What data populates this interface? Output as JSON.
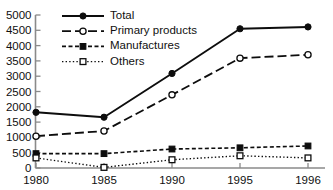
{
  "chart_data": {
    "type": "line",
    "title": "",
    "subtitle": "",
    "xlabel": "",
    "ylabel": "",
    "categories": [
      "1980",
      "1985",
      "1990",
      "1995",
      "1996"
    ],
    "x": [
      1980,
      1985,
      1990,
      1995,
      1996
    ],
    "ylim": [
      0,
      5000
    ],
    "yticks": [
      0,
      500,
      1000,
      1500,
      2000,
      2500,
      3000,
      3500,
      4000,
      4500,
      5000
    ],
    "ytick_labels": [
      "0",
      "500",
      "1000",
      "1500",
      "2000",
      "2500",
      "3000",
      "3500",
      "4000",
      "4500",
      "5000"
    ],
    "xtick_labels": [
      "1980",
      "1985",
      "1990",
      "1995",
      "1996"
    ],
    "grid": false,
    "legend_position": "top-center-inside",
    "series": [
      {
        "name": "Total",
        "values": [
          1820,
          1660,
          3090,
          4550,
          4610
        ],
        "line_style": "solid",
        "marker": "filled-circle",
        "color": "#0d0d0d"
      },
      {
        "name": "Primary products",
        "values": [
          1040,
          1210,
          2390,
          3590,
          3700
        ],
        "line_style": "long-dash",
        "marker": "open-circle",
        "color": "#0d0d0d"
      },
      {
        "name": "Manufactures",
        "values": [
          470,
          470,
          620,
          660,
          720
        ],
        "line_style": "short-dash",
        "marker": "filled-square",
        "color": "#0d0d0d"
      },
      {
        "name": "Others",
        "values": [
          330,
          20,
          270,
          400,
          330
        ],
        "line_style": "dotted",
        "marker": "open-square",
        "color": "#0d0d0d"
      }
    ]
  },
  "axes": {
    "axis_color": "#8a8a8a",
    "background": "#ffffff"
  }
}
